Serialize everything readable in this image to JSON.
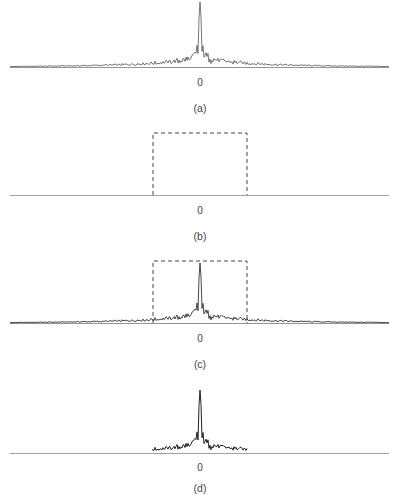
{
  "figure": {
    "panels": [
      {
        "id": "a",
        "caption": "(a)",
        "origin_label": "0"
      },
      {
        "id": "b",
        "caption": "(b)",
        "origin_label": "0"
      },
      {
        "id": "c",
        "caption": "(c)",
        "origin_label": "0"
      },
      {
        "id": "d",
        "caption": "(d)",
        "origin_label": "0"
      }
    ]
  },
  "chart_data": [
    {
      "type": "line",
      "title": "(a)",
      "description": "Sinc-like spectrum: tall central peak at origin with decaying oscillating sidelobes across full width",
      "xlabel": "",
      "ylabel": "",
      "x_tick_labels": [
        "0"
      ],
      "x": [
        -1.0,
        -0.5,
        -0.25,
        -0.1,
        -0.05,
        -0.02,
        0,
        0.02,
        0.05,
        0.1,
        0.25,
        0.5,
        1.0
      ],
      "values": [
        0.01,
        0.05,
        0.1,
        0.15,
        0.3,
        0.55,
        1.0,
        0.55,
        0.3,
        0.15,
        0.1,
        0.05,
        0.01
      ],
      "grid": false
    },
    {
      "type": "line",
      "title": "(b)",
      "description": "Rectangular (dashed) window function centered at origin",
      "xlabel": "",
      "ylabel": "",
      "x_tick_labels": [
        "0"
      ],
      "window": {
        "x_start": -0.5,
        "x_end": 0.5,
        "height": 1.0,
        "style": "dashed"
      },
      "grid": false
    },
    {
      "type": "line",
      "title": "(c)",
      "description": "Spectrum from (a) overlaid with dashed rectangular window from (b)",
      "xlabel": "",
      "ylabel": "",
      "x_tick_labels": [
        "0"
      ],
      "window": {
        "x_start": -0.5,
        "x_end": 0.5,
        "height": 1.0,
        "style": "dashed"
      },
      "grid": false
    },
    {
      "type": "line",
      "title": "(d)",
      "description": "Windowed spectrum: product of (a) and (b); signal truncated outside window",
      "xlabel": "",
      "ylabel": "",
      "x_tick_labels": [
        "0"
      ],
      "support": [
        -0.5,
        0.5
      ],
      "grid": false
    }
  ]
}
